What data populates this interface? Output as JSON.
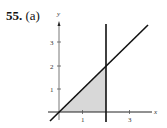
{
  "problem": {
    "number": "55.",
    "part": "(a)"
  },
  "axes": {
    "x_label": "x",
    "y_label": "y",
    "x_ticks": [
      "1",
      "3"
    ],
    "y_ticks": [
      "1",
      "2",
      "3"
    ]
  },
  "figure": {
    "lines": [
      {
        "name": "y = x",
        "type": "diagonal"
      },
      {
        "name": "x = 2",
        "type": "vertical"
      }
    ],
    "shaded_region": {
      "vertices": [
        [
          0,
          0
        ],
        [
          2,
          0
        ],
        [
          2,
          2
        ]
      ],
      "color": "#d8d8d8"
    }
  }
}
